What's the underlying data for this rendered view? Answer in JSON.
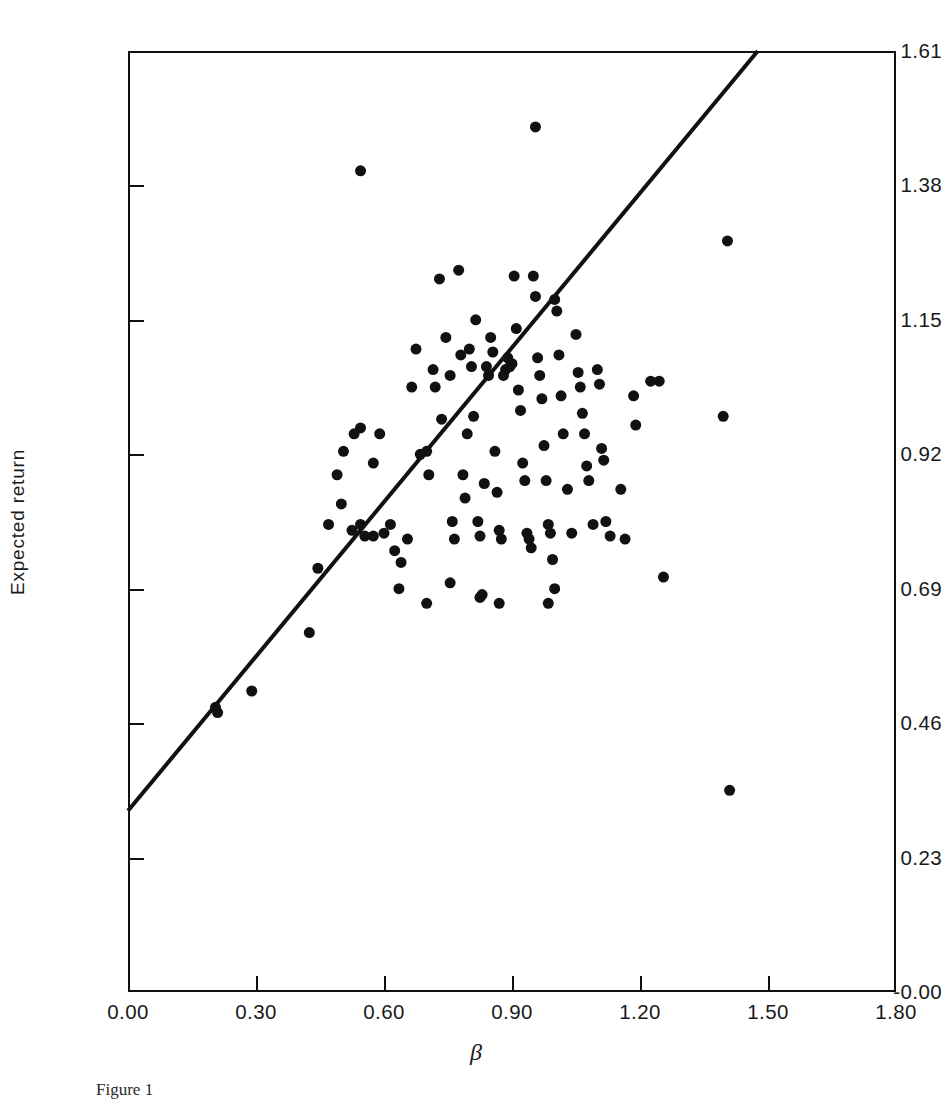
{
  "figure": {
    "caption": "Figure 1",
    "background_color": "#ffffff",
    "ink_color": "#111111"
  },
  "chart_data": {
    "type": "scatter",
    "title": "",
    "subtitle": "",
    "xlabel": "β",
    "ylabel": "Expected return",
    "xlim": [
      0.0,
      1.8
    ],
    "ylim": [
      0.0,
      1.61
    ],
    "grid": false,
    "legend": null,
    "x_ticks": [
      "0.00",
      "0.30",
      "0.60",
      "0.90",
      "1.20",
      "1.50",
      "1.80"
    ],
    "x_tick_values": [
      0.0,
      0.3,
      0.6,
      0.9,
      1.2,
      1.5,
      1.8
    ],
    "y_ticks": [
      "-0.00",
      "0.23",
      "0.46",
      "0.69",
      "0.92",
      "1.15",
      "1.38",
      "1.61"
    ],
    "y_tick_values": [
      0.0,
      0.23,
      0.46,
      0.69,
      0.92,
      1.15,
      1.38,
      1.61
    ],
    "marker": {
      "shape": "circle",
      "color": "#111111",
      "size_px": 11
    },
    "fit_line": {
      "label": "security market line",
      "color": "#111111",
      "width_px": 4,
      "intercept": 0.31,
      "slope": 0.874,
      "x_start": 0.0,
      "y_start": 0.31,
      "x_end": 1.476,
      "y_end": 1.61
    },
    "n_points": 118,
    "points": [
      [
        0.545,
        1.405
      ],
      [
        0.955,
        1.48
      ],
      [
        1.405,
        1.285
      ],
      [
        1.395,
        0.985
      ],
      [
        1.41,
        0.345
      ],
      [
        0.205,
        0.487
      ],
      [
        0.21,
        0.478
      ],
      [
        0.29,
        0.515
      ],
      [
        0.425,
        0.615
      ],
      [
        0.445,
        0.725
      ],
      [
        0.47,
        0.8
      ],
      [
        0.49,
        0.885
      ],
      [
        0.5,
        0.835
      ],
      [
        0.505,
        0.925
      ],
      [
        0.53,
        0.955
      ],
      [
        0.545,
        0.965
      ],
      [
        0.575,
        0.905
      ],
      [
        0.59,
        0.955
      ],
      [
        0.525,
        0.79
      ],
      [
        0.545,
        0.8
      ],
      [
        0.555,
        0.78
      ],
      [
        0.575,
        0.78
      ],
      [
        0.6,
        0.785
      ],
      [
        0.615,
        0.8
      ],
      [
        0.625,
        0.755
      ],
      [
        0.635,
        0.69
      ],
      [
        0.655,
        0.775
      ],
      [
        0.665,
        1.035
      ],
      [
        0.675,
        1.1
      ],
      [
        0.685,
        0.92
      ],
      [
        0.7,
        0.925
      ],
      [
        0.705,
        0.885
      ],
      [
        0.715,
        1.065
      ],
      [
        0.72,
        1.035
      ],
      [
        0.73,
        1.22
      ],
      [
        0.735,
        0.98
      ],
      [
        0.745,
        1.12
      ],
      [
        0.755,
        1.055
      ],
      [
        0.76,
        0.805
      ],
      [
        0.765,
        0.775
      ],
      [
        0.775,
        1.235
      ],
      [
        0.78,
        1.09
      ],
      [
        0.785,
        0.885
      ],
      [
        0.79,
        0.845
      ],
      [
        0.795,
        0.955
      ],
      [
        0.8,
        1.1
      ],
      [
        0.805,
        1.07
      ],
      [
        0.81,
        0.985
      ],
      [
        0.815,
        1.15
      ],
      [
        0.82,
        0.805
      ],
      [
        0.825,
        0.78
      ],
      [
        0.83,
        0.68
      ],
      [
        0.835,
        0.87
      ],
      [
        0.84,
        1.07
      ],
      [
        0.845,
        1.055
      ],
      [
        0.85,
        1.12
      ],
      [
        0.855,
        1.095
      ],
      [
        0.86,
        0.925
      ],
      [
        0.865,
        0.855
      ],
      [
        0.87,
        0.79
      ],
      [
        0.875,
        0.775
      ],
      [
        0.88,
        1.055
      ],
      [
        0.885,
        1.065
      ],
      [
        0.89,
        1.085
      ],
      [
        0.895,
        1.07
      ],
      [
        0.9,
        1.075
      ],
      [
        0.905,
        1.225
      ],
      [
        0.91,
        1.135
      ],
      [
        0.915,
        1.03
      ],
      [
        0.92,
        0.995
      ],
      [
        0.925,
        0.905
      ],
      [
        0.93,
        0.875
      ],
      [
        0.935,
        0.785
      ],
      [
        0.94,
        0.775
      ],
      [
        0.945,
        0.76
      ],
      [
        0.95,
        1.225
      ],
      [
        0.955,
        1.19
      ],
      [
        0.96,
        1.085
      ],
      [
        0.965,
        1.055
      ],
      [
        0.97,
        1.015
      ],
      [
        0.975,
        0.935
      ],
      [
        0.98,
        0.875
      ],
      [
        0.985,
        0.8
      ],
      [
        0.99,
        0.785
      ],
      [
        0.995,
        0.74
      ],
      [
        1.0,
        1.185
      ],
      [
        1.005,
        1.165
      ],
      [
        1.01,
        1.09
      ],
      [
        1.015,
        1.02
      ],
      [
        1.02,
        0.955
      ],
      [
        1.03,
        0.86
      ],
      [
        1.04,
        0.785
      ],
      [
        1.05,
        1.125
      ],
      [
        1.055,
        1.06
      ],
      [
        1.06,
        1.035
      ],
      [
        1.065,
        0.99
      ],
      [
        1.07,
        0.955
      ],
      [
        1.075,
        0.9
      ],
      [
        1.08,
        0.875
      ],
      [
        1.09,
        0.8
      ],
      [
        1.1,
        1.065
      ],
      [
        1.105,
        1.04
      ],
      [
        1.11,
        0.93
      ],
      [
        1.115,
        0.91
      ],
      [
        1.12,
        0.805
      ],
      [
        1.13,
        0.78
      ],
      [
        1.155,
        0.86
      ],
      [
        1.165,
        0.775
      ],
      [
        1.185,
        1.02
      ],
      [
        1.19,
        0.97
      ],
      [
        1.225,
        1.045
      ],
      [
        1.245,
        1.045
      ],
      [
        1.255,
        0.71
      ],
      [
        0.7,
        0.665
      ],
      [
        0.825,
        0.675
      ],
      [
        0.87,
        0.665
      ],
      [
        1.0,
        0.69
      ],
      [
        0.64,
        0.735
      ],
      [
        0.755,
        0.7
      ],
      [
        0.985,
        0.665
      ]
    ]
  }
}
